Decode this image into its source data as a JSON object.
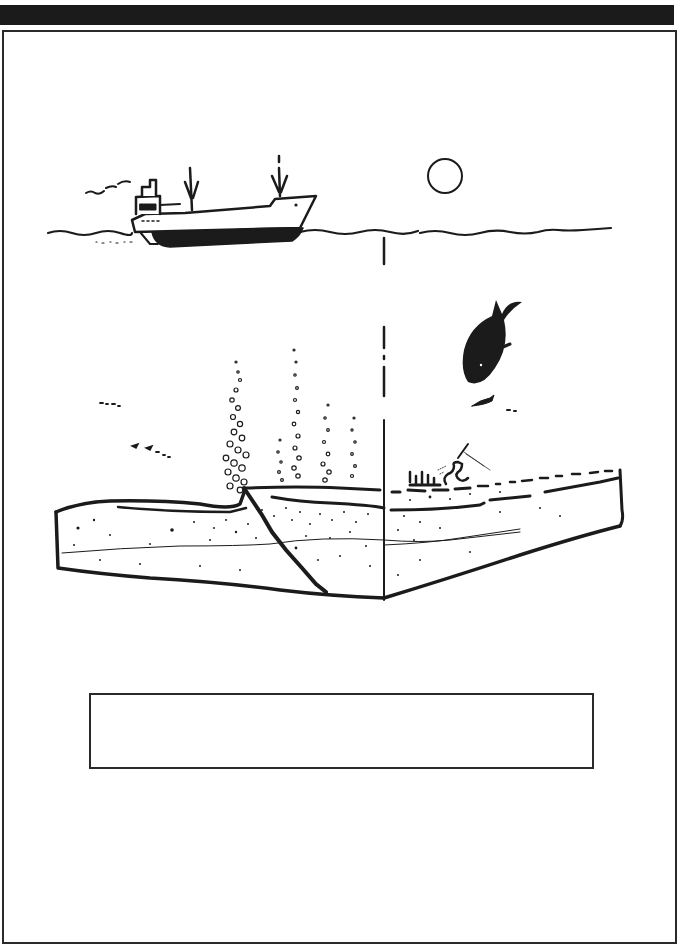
{
  "figure": {
    "type": "line-illustration",
    "elements": [
      {
        "id": "ship",
        "label": "research vessel on surface"
      },
      {
        "id": "sun",
        "label": "sun"
      },
      {
        "id": "sea-surface",
        "label": "wavy sea-surface line"
      },
      {
        "id": "survey-line",
        "label": "dashed vertical line below sun"
      },
      {
        "id": "whale",
        "label": "diving whale"
      },
      {
        "id": "fish",
        "label": "small fish"
      },
      {
        "id": "bubble-plumes",
        "label": "gas bubble plumes rising from seafloor"
      },
      {
        "id": "seafloor-block",
        "label": "sediment block with layers"
      },
      {
        "id": "fault",
        "label": "diagonal fault line through block"
      },
      {
        "id": "seabed-life",
        "label": "benthic organisms on seafloor"
      }
    ]
  },
  "caption": {
    "text": ""
  },
  "colors": {
    "ink": "#1b1b1b",
    "paper": "#ffffff",
    "topbar": "#1b1b1b",
    "frame": "#2a2a2a"
  }
}
